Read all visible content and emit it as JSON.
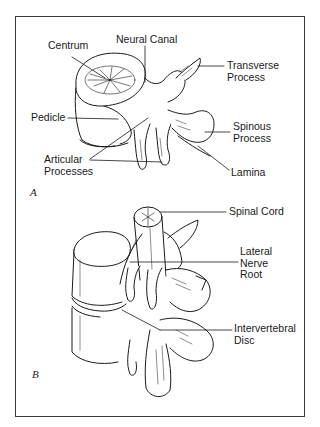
{
  "figure": {
    "panel_a": {
      "label": "A",
      "parts": [
        {
          "id": "centrum",
          "line1": "Centrum"
        },
        {
          "id": "neural-canal",
          "line1": "Neural Canal"
        },
        {
          "id": "transverse-process",
          "line1": "Transverse",
          "line2": "Process"
        },
        {
          "id": "pedicle",
          "line1": "Pedicle"
        },
        {
          "id": "spinous-process",
          "line1": "Spinous",
          "line2": "Process"
        },
        {
          "id": "articular-processes",
          "line1": "Articular",
          "line2": "Processes"
        },
        {
          "id": "lamina",
          "line1": "Lamina"
        }
      ]
    },
    "panel_b": {
      "label": "B",
      "parts": [
        {
          "id": "spinal-cord",
          "line1": "Spinal Cord"
        },
        {
          "id": "lateral-nerve-root",
          "line1": "Lateral",
          "line2": "Nerve",
          "line3": "Root"
        },
        {
          "id": "intervertebral-disc",
          "line1": "Intervertebral",
          "line2": "Disc"
        }
      ]
    }
  },
  "colors": {
    "ink": "#1a1a1a",
    "frame": "#3a3a3a",
    "background": "#ffffff"
  }
}
